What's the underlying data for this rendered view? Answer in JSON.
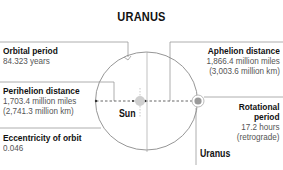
{
  "title": "URANUS",
  "colors": {
    "text": "#111111",
    "value_text": "#555555",
    "lines": "#999999",
    "orbit": "#8a8a8a",
    "sun": "#c8c8c8",
    "planet": "#9a9a9a"
  },
  "labels": {
    "orbital_period": {
      "heading": "Orbital period",
      "value": "84.323 years"
    },
    "perihelion": {
      "heading": "Perihelion distance",
      "value1": "1,703.4 million miles",
      "value2": "(2,741.3 million km)"
    },
    "eccentricity": {
      "heading": "Eccentricity of orbit",
      "value": "0.046"
    },
    "aphelion": {
      "heading": "Aphelion distance",
      "value1": "1,866.4 million miles",
      "value2": "(3,003.6 million km)"
    },
    "rotational": {
      "heading1": "Rotational",
      "heading2": "period",
      "value1": "17.2 hours",
      "value2": "(retrograde)"
    }
  },
  "bodies": {
    "sun": "Sun",
    "planet": "Uranus"
  }
}
